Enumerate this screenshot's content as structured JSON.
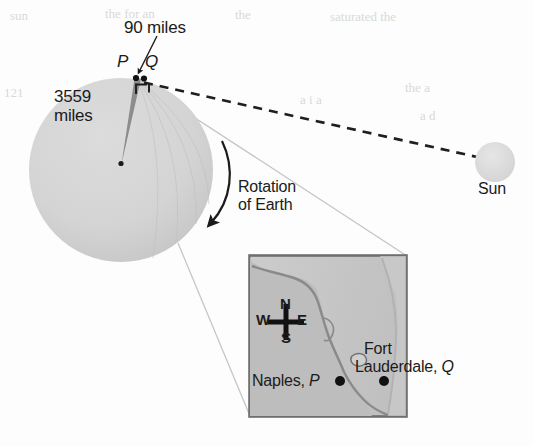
{
  "figure": {
    "type": "earth-sun-geometry-diagram",
    "labels": {
      "distance_top": "90 miles",
      "point_p": "P",
      "point_q": "Q",
      "earth_radius": "3559\nmiles",
      "rotation": "Rotation\nof Earth",
      "sun": "Sun"
    }
  },
  "earth": {
    "name": "earth-circle",
    "center_x": 121,
    "center_y": 170,
    "radius": 92,
    "fill": "#d5d5d5",
    "radius_label": "3559\nmiles",
    "center_dot": {
      "x": 121,
      "y": 163
    },
    "surface_points": [
      {
        "label": "P",
        "x": 136,
        "y": 78
      },
      {
        "label": "Q",
        "x": 143,
        "y": 78
      }
    ],
    "wedge_fill": "#8c8c8c"
  },
  "sun": {
    "name": "sun-circle",
    "center_x": 495,
    "center_y": 162,
    "radius": 20,
    "fill": "#dedede",
    "label": "Sun"
  },
  "sight_line": {
    "name": "dashed-sight-line",
    "from": {
      "x": 144,
      "y": 83
    },
    "to": {
      "x": 477,
      "y": 158
    },
    "style": "dashed",
    "color": "#202020"
  },
  "right_angle_mark": {
    "x": 137,
    "y": 83,
    "size": 11
  },
  "rotation_arrow": {
    "name": "rotation-arrow",
    "label": "Rotation\nof Earth",
    "direction": "clockwise-downward"
  },
  "inset_map": {
    "name": "florida-inset-map",
    "box": {
      "x": 249,
      "y": 255,
      "width": 158,
      "height": 162
    },
    "land_fill": "#b9b9b9",
    "water_fill": "#cfcfcf",
    "border": "#7a7a7a",
    "compass": {
      "north": "N",
      "south": "S",
      "east": "E",
      "west": "W",
      "center": {
        "x": 286,
        "y": 322
      }
    },
    "cities": [
      {
        "name": "Naples",
        "point": "P",
        "label": "Naples, ",
        "italic": "P",
        "dot": {
          "x": 340,
          "y": 381
        }
      },
      {
        "name": "Fort Lauderdale",
        "point": "Q",
        "label_line1": "Fort",
        "label_line2": "Lauderdale, ",
        "italic": "Q",
        "dot": {
          "x": 384,
          "y": 381
        }
      }
    ]
  },
  "connector_lines": {
    "name": "inset-connector-lines",
    "count": 2,
    "color": "#c2c2c2"
  },
  "background_ghost_text": {
    "note": "faint show-through text from reverse of page",
    "fragments": [
      "sun",
      "the for an",
      "the",
      "a",
      "saturated the",
      "121",
      "a i a",
      "the a",
      "a d"
    ]
  },
  "colors": {
    "ink": "#1b1b1b",
    "earth_gray": "#d5d5d5",
    "wedge_gray": "#8c8c8c",
    "sun_gray": "#dedede",
    "page": "#fdfdfd"
  }
}
